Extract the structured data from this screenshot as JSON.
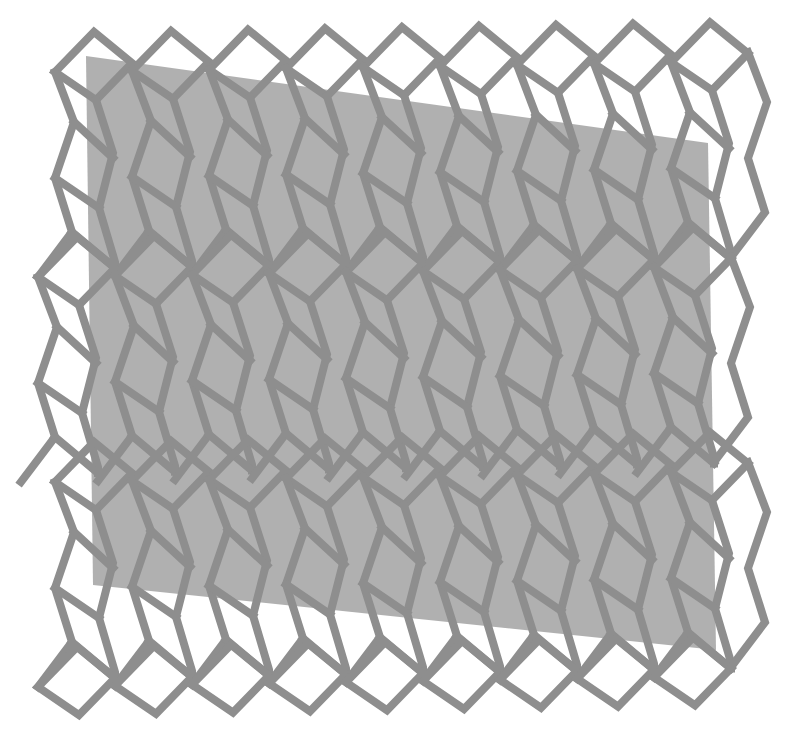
{
  "artwork": {
    "width": 801,
    "height": 744,
    "background": "#ffffff",
    "plane": {
      "fill": "#9a9a9a",
      "opacity": 0.78,
      "points": [
        [
          86,
          56
        ],
        [
          708,
          143
        ],
        [
          716,
          650
        ],
        [
          93,
          585
        ]
      ]
    },
    "lattice": {
      "stroke": "#8e8e8e",
      "stroke_width": 8,
      "columns": 9,
      "rows": 3,
      "origin": [
        55,
        72
      ],
      "col_step": [
        77,
        -1.2
      ],
      "row_step": [
        -17,
        205
      ],
      "unit": {
        "diamond": [
          [
            0,
            0
          ],
          [
            39,
            -40
          ],
          [
            77,
            -9
          ],
          [
            41,
            28
          ]
        ],
        "left_line": [
          [
            0,
            0
          ],
          [
            19,
            50
          ],
          [
            0,
            106
          ],
          [
            17,
            160
          ],
          [
            -17,
            205
          ]
        ],
        "inner_line": [
          [
            41,
            28
          ],
          [
            58,
            81
          ],
          [
            44,
            136
          ],
          [
            60,
            190
          ],
          [
            60,
            196
          ]
        ],
        "links": [
          [
            [
              19,
              50
            ],
            [
              58,
              86
            ]
          ],
          [
            [
              0,
              106
            ],
            [
              44,
              136
            ]
          ],
          [
            [
              17,
              160
            ],
            [
              60,
              196
            ]
          ]
        ]
      },
      "bottom_diamond_row": true
    }
  }
}
